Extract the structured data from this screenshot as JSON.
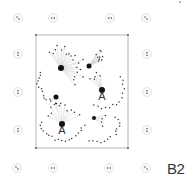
{
  "diagram": {
    "label": "B2",
    "colors": {
      "background": "#ffffff",
      "frame": "#888888",
      "marker_ring": "#dddddd",
      "marker_dot": "#333333",
      "hub": "#111111",
      "node": "#333333",
      "link": "#bbbbbb",
      "text": "#333333"
    },
    "frame": {
      "x": 36,
      "y": 35,
      "width": 92,
      "height": 113
    },
    "outer_markers": [
      {
        "x": 18,
        "y": 18
      },
      {
        "x": 53,
        "y": 18
      },
      {
        "x": 110,
        "y": 18
      },
      {
        "x": 146,
        "y": 18
      },
      {
        "x": 18,
        "y": 54
      },
      {
        "x": 147,
        "y": 54
      },
      {
        "x": 18,
        "y": 92
      },
      {
        "x": 147,
        "y": 92
      },
      {
        "x": 18,
        "y": 130
      },
      {
        "x": 147,
        "y": 130
      },
      {
        "x": 17,
        "y": 168
      },
      {
        "x": 53,
        "y": 168
      },
      {
        "x": 109,
        "y": 168
      },
      {
        "x": 146,
        "y": 168
      }
    ],
    "hubs": [
      {
        "id": "h1",
        "x": 61,
        "y": 68,
        "r": 3,
        "label": ""
      },
      {
        "id": "h2",
        "x": 89,
        "y": 66,
        "r": 2.5,
        "label": ""
      },
      {
        "id": "h3",
        "x": 102,
        "y": 90,
        "r": 3,
        "label": "A"
      },
      {
        "id": "h4",
        "x": 56,
        "y": 97,
        "r": 2.5,
        "label": ""
      },
      {
        "id": "h5",
        "x": 62,
        "y": 124,
        "r": 3,
        "label": "A"
      },
      {
        "id": "h6",
        "x": 94,
        "y": 118,
        "r": 2,
        "label": ""
      }
    ]
  }
}
